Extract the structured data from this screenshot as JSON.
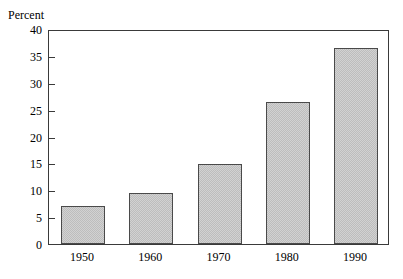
{
  "chart_data": {
    "type": "bar",
    "title": "",
    "ylabel": "Percent",
    "xlabel": "",
    "categories": [
      "1950",
      "1960",
      "1970",
      "1980",
      "1990"
    ],
    "values": [
      7.1,
      9.4,
      14.8,
      26.5,
      36.5
    ],
    "ylim": [
      0,
      40
    ],
    "ytick_labels": [
      "0",
      "5",
      "10",
      "15",
      "20",
      "25",
      "30",
      "35",
      "40"
    ],
    "ytick_values": [
      0,
      5,
      10,
      15,
      20,
      25,
      30,
      35,
      40
    ],
    "grid": false,
    "legend": "none",
    "bar_fill_color": "#d2d2d2",
    "bar_border_color": "#4a4a4a",
    "frame_color": "#3a3a3a",
    "background_color": "#ffffff"
  }
}
